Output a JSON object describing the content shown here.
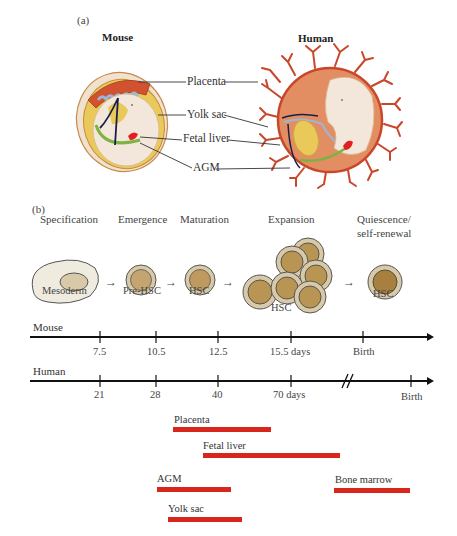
{
  "panels": {
    "a": {
      "label": "(a)",
      "mouse_title": "Mouse",
      "human_title": "Human",
      "callouts": [
        "Placenta",
        "Yolk sac",
        "Fetal liver",
        "AGM"
      ]
    },
    "b": {
      "label": "(b)",
      "stages": [
        {
          "name": "Specification",
          "cell": "Mesoderm"
        },
        {
          "name": "Emergence",
          "cell": "Pre-HSC"
        },
        {
          "name": "Maturation",
          "cell": "HSC"
        },
        {
          "name": "Expansion",
          "cell": "HSC"
        },
        {
          "name": "Quiescence/",
          "name2": "self-renewal",
          "cell": "HSC"
        }
      ],
      "timelines": {
        "mouse": {
          "name": "Mouse",
          "ticks": [
            "7.5",
            "10.5",
            "12.5",
            "15.5 days",
            "Birth"
          ]
        },
        "human": {
          "name": "Human",
          "ticks": [
            "21",
            "28",
            "40",
            "70 days",
            "Birth"
          ]
        }
      },
      "sites": [
        {
          "name": "Placenta",
          "color": "#d9261c"
        },
        {
          "name": "Fetal liver",
          "color": "#d9261c"
        },
        {
          "name": "AGM",
          "color": "#d9261c"
        },
        {
          "name": "Bone marrow",
          "color": "#d9261c"
        },
        {
          "name": "Yolk sac",
          "color": "#d9261c"
        }
      ]
    }
  },
  "colors": {
    "site_bar": "#d9261c",
    "cell_outer": "#d8c9a8",
    "cell_inner": "#b99554",
    "mesoderm": "#efebdf",
    "placenta_red": "#c8472a",
    "human_sac": "#e38d63",
    "yolk": "#e8c95a",
    "embryo": "#f2e4d8",
    "vessel": "#1a1f4a"
  }
}
